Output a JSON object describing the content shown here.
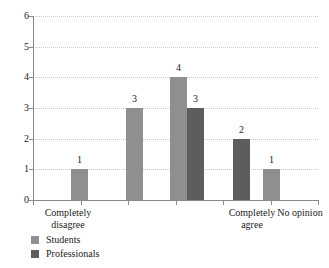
{
  "chart_data": {
    "type": "bar",
    "title": "",
    "subtitle": "",
    "xlabel": "",
    "ylabel": "",
    "ylim": [
      0,
      6
    ],
    "yticks": [
      "0",
      "1",
      "2",
      "3",
      "4",
      "5",
      "6"
    ],
    "grid": "horizontal-dotted",
    "legend_position": "bottom-left",
    "categories": [
      "Completely disagree",
      "",
      "",
      "Completely agree",
      "No opinion"
    ],
    "category_labels_visible": [
      {
        "index": 0,
        "line1": "Completely",
        "line2": "disagree"
      },
      {
        "index": 3,
        "line1": "Completely",
        "line2": "agree"
      },
      {
        "index": 4,
        "line1": "No opinion",
        "line2": ""
      }
    ],
    "series": [
      {
        "name": "Students",
        "color": "#8f8f8f",
        "values": [
          1,
          3,
          4,
          null,
          1
        ]
      },
      {
        "name": "Professionals",
        "color": "#5d5d5d",
        "values": [
          null,
          null,
          3,
          2,
          null
        ]
      }
    ],
    "bars": [
      {
        "category_index": 0,
        "series": "Students",
        "value": 1,
        "label": "1",
        "x": 38,
        "w": 17
      },
      {
        "category_index": 1,
        "series": "Students",
        "value": 3,
        "label": "3",
        "x": 93,
        "w": 17
      },
      {
        "category_index": 2,
        "series": "Students",
        "value": 4,
        "label": "4",
        "x": 137,
        "w": 17
      },
      {
        "category_index": 2,
        "series": "Professionals",
        "value": 3,
        "label": "3",
        "x": 154,
        "w": 17
      },
      {
        "category_index": 3,
        "series": "Professionals",
        "value": 2,
        "label": "2",
        "x": 200,
        "w": 17
      },
      {
        "category_index": 4,
        "series": "Students",
        "value": 1,
        "label": "1",
        "x": 230,
        "w": 17
      }
    ],
    "legend": [
      {
        "label": "Students",
        "color": "#8f8f8f"
      },
      {
        "label": "Professionals",
        "color": "#5d5d5d"
      }
    ]
  },
  "axis": {
    "y_labels": [
      "6",
      "5",
      "4",
      "3",
      "2",
      "1",
      "0"
    ],
    "x_tick_count": 7
  },
  "colors": {
    "students": "#8f8f8f",
    "professionals": "#5d5d5d",
    "axis": "#8a8a8a",
    "grid": "#c9c9c9",
    "text": "#1a1a1a",
    "background": "#ffffff"
  }
}
